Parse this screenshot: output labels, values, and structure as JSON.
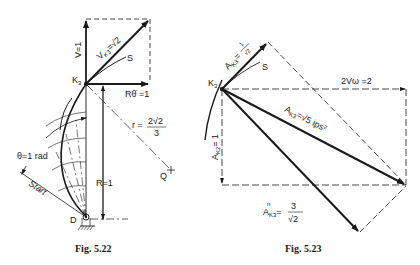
{
  "figures": [
    {
      "caption": "Fig. 5.22",
      "labels": {
        "v": "V=1",
        "vk3": "V",
        "vk3_sub": "K3",
        "vk3_eq": "=√2",
        "s": "S",
        "k3": "K",
        "k3_sub": "3",
        "rtheta": "Rθ̇ =1",
        "r_prefix": "r =",
        "r_num": "2√2",
        "r_den": "3",
        "q": "Q",
        "theta": "θ=1 rad",
        "start": "Start",
        "R": "R=1",
        "d": "D"
      }
    },
    {
      "caption": "Fig. 5.23",
      "labels": {
        "at": "A",
        "at_sub": "K3",
        "at_eq_num": "1",
        "at_eq_den": "√2",
        "s": "S",
        "k3": "K",
        "k3_sub": "3",
        "coriolis": "2Vω =2",
        "ak3": "A",
        "ak3_sub": "K3",
        "ak3_eq": "=√5 ips²",
        "ak2n": "A",
        "ak2n_sub": "K2",
        "ak2n_eq": "= 1",
        "ak3n": "A",
        "ak3n_sup": "n",
        "ak3n_sub": "K3",
        "ak3n_num": "3",
        "ak3n_den": "√2"
      }
    }
  ]
}
